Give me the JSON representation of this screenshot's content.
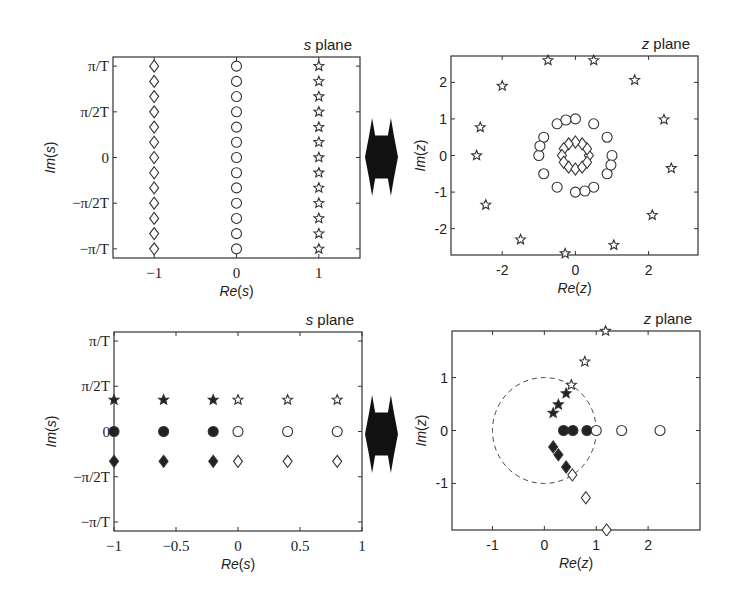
{
  "chart_data": [
    {
      "id": "s_top",
      "type": "scatter",
      "title": "s plane",
      "xlabel": "Re(s)",
      "ylabel": "Im(s)",
      "box": [
        113,
        57,
        360,
        258
      ],
      "xlim": [
        -1.5,
        1.5
      ],
      "ylim": [
        -1.1,
        1.1
      ],
      "xticks": [
        {
          "v": -1,
          "label": "−1"
        },
        {
          "v": 0,
          "label": "0"
        },
        {
          "v": 1,
          "label": "1"
        }
      ],
      "yticks": [
        {
          "v": 1,
          "label": "π/T"
        },
        {
          "v": 0.5,
          "label": "π/2T"
        },
        {
          "v": 0,
          "label": "0"
        },
        {
          "v": -0.5,
          "label": "−π/2T"
        },
        {
          "v": -1,
          "label": "−π/T"
        }
      ],
      "tickfont": "serif",
      "y_unit": "pi/T",
      "series": [
        {
          "name": "diamonds",
          "marker": "diamond",
          "filled": false,
          "x": [
            -1,
            -1,
            -1,
            -1,
            -1,
            -1,
            -1,
            -1,
            -1,
            -1,
            -1,
            -1,
            -1
          ],
          "y": [
            1,
            0.833,
            0.667,
            0.5,
            0.333,
            0.167,
            0,
            -0.167,
            -0.333,
            -0.5,
            -0.667,
            -0.833,
            -1
          ]
        },
        {
          "name": "circles",
          "marker": "circle",
          "filled": false,
          "x": [
            0,
            0,
            0,
            0,
            0,
            0,
            0,
            0,
            0,
            0,
            0,
            0,
            0
          ],
          "y": [
            1,
            0.833,
            0.667,
            0.5,
            0.333,
            0.167,
            0,
            -0.167,
            -0.333,
            -0.5,
            -0.667,
            -0.833,
            -1
          ]
        },
        {
          "name": "stars",
          "marker": "star",
          "filled": false,
          "x": [
            1,
            1,
            1,
            1,
            1,
            1,
            1,
            1,
            1,
            1,
            1,
            1,
            1
          ],
          "y": [
            1,
            0.833,
            0.667,
            0.5,
            0.333,
            0.167,
            0,
            -0.167,
            -0.333,
            -0.5,
            -0.667,
            -0.833,
            -1
          ]
        }
      ]
    },
    {
      "id": "z_top",
      "type": "scatter",
      "title": "z plane",
      "xlabel": "Re(z)",
      "ylabel": "Im(z)",
      "box": [
        451,
        56,
        698,
        255
      ],
      "xlim": [
        -3.4,
        3.35
      ],
      "ylim": [
        -2.72,
        2.72
      ],
      "xticks": [
        {
          "v": -2,
          "label": "-2"
        },
        {
          "v": 0,
          "label": "0"
        },
        {
          "v": 2,
          "label": "2"
        }
      ],
      "yticks": [
        {
          "v": 2,
          "label": "2"
        },
        {
          "v": 1,
          "label": "1"
        },
        {
          "v": 0,
          "label": "0"
        },
        {
          "v": -1,
          "label": "-1"
        },
        {
          "v": -2,
          "label": "-2"
        }
      ],
      "tickfont": "sans",
      "series": [
        {
          "name": "diamonds (|z|=e^-1)",
          "marker": "diamond",
          "filled": false,
          "x": [
            0.368,
            0.319,
            0.184,
            0,
            -0.184,
            -0.319,
            -0.368,
            -0.319,
            -0.184,
            0,
            0.184,
            0.319
          ],
          "y": [
            0,
            0.184,
            0.319,
            0.368,
            0.319,
            0.184,
            0,
            -0.184,
            -0.319,
            -0.368,
            -0.319,
            -0.184
          ]
        },
        {
          "name": "circles (|z|=1)",
          "marker": "circle",
          "filled": false,
          "x": [
            1,
            0.866,
            0.5,
            0,
            -0.5,
            -0.866,
            -1,
            -0.866,
            -0.5,
            0,
            0.5,
            0.866,
            -0.26,
            0.26,
            -0.97,
            0.97
          ],
          "y": [
            0,
            0.5,
            0.866,
            1,
            0.866,
            0.5,
            0,
            -0.5,
            -0.866,
            -1,
            -0.866,
            -0.5,
            0.97,
            -0.97,
            0.26,
            -0.26
          ]
        },
        {
          "name": "stars (|z|=e)",
          "marker": "star",
          "filled": false,
          "x": [
            -0.75,
            0.5,
            1.62,
            2.42,
            2.62,
            2.1,
            1.05,
            -0.28,
            -1.5,
            -2.45,
            -2.7,
            -2.6,
            -2.0
          ],
          "y": [
            2.6,
            2.6,
            2.06,
            0.98,
            -0.35,
            -1.63,
            -2.45,
            -2.68,
            -2.3,
            -1.35,
            0,
            0.77,
            1.9
          ]
        }
      ]
    },
    {
      "id": "s_bottom",
      "type": "scatter",
      "title": "s plane",
      "xlabel": "Re(s)",
      "ylabel": "Im(s)",
      "box": [
        114,
        332,
        362,
        531
      ],
      "xlim": [
        -1,
        1
      ],
      "ylim": [
        -1.1,
        1.1
      ],
      "xticks": [
        {
          "v": -1,
          "label": "−1"
        },
        {
          "v": -0.5,
          "label": "−0.5"
        },
        {
          "v": 0,
          "label": "0"
        },
        {
          "v": 0.5,
          "label": "0.5"
        },
        {
          "v": 1,
          "label": "1"
        }
      ],
      "yticks": [
        {
          "v": 1,
          "label": "π/T"
        },
        {
          "v": 0.5,
          "label": "π/2T"
        },
        {
          "v": 0,
          "label": "0"
        },
        {
          "v": -0.5,
          "label": "−π/2T"
        },
        {
          "v": -1,
          "label": "−π/T"
        }
      ],
      "tickfont": "serif",
      "y_unit": "pi/T",
      "series": [
        {
          "name": "filled stars",
          "marker": "star",
          "filled": true,
          "x": [
            -1,
            -0.6,
            -0.2
          ],
          "y": [
            0.35,
            0.35,
            0.35
          ]
        },
        {
          "name": "filled circles",
          "marker": "circle",
          "filled": true,
          "x": [
            -1,
            -0.6,
            -0.2
          ],
          "y": [
            0,
            0,
            0
          ]
        },
        {
          "name": "filled diamonds",
          "marker": "diamond",
          "filled": true,
          "x": [
            -1,
            -0.6,
            -0.2
          ],
          "y": [
            -0.33,
            -0.33,
            -0.33
          ]
        },
        {
          "name": "hollow stars",
          "marker": "star",
          "filled": false,
          "x": [
            0,
            0.4,
            0.8
          ],
          "y": [
            0.35,
            0.35,
            0.35
          ]
        },
        {
          "name": "hollow circles",
          "marker": "circle",
          "filled": false,
          "x": [
            0,
            0.4,
            0.8
          ],
          "y": [
            0,
            0,
            0
          ]
        },
        {
          "name": "hollow diamonds",
          "marker": "diamond",
          "filled": false,
          "x": [
            0,
            0.4,
            0.8
          ],
          "y": [
            -0.33,
            -0.33,
            -0.33
          ]
        }
      ]
    },
    {
      "id": "z_bottom",
      "type": "scatter",
      "title": "z plane",
      "xlabel": "Re(z)",
      "ylabel": "Im(z)",
      "box": [
        452,
        331,
        700,
        530
      ],
      "xlim": [
        -1.78,
        3.0
      ],
      "ylim": [
        -1.88,
        1.88
      ],
      "xticks": [
        {
          "v": -1,
          "label": "-1"
        },
        {
          "v": 0,
          "label": "0"
        },
        {
          "v": 1,
          "label": "1"
        },
        {
          "v": 2,
          "label": "2"
        }
      ],
      "yticks": [
        {
          "v": 1,
          "label": "1"
        },
        {
          "v": 0,
          "label": "0"
        },
        {
          "v": -1,
          "label": "-1"
        }
      ],
      "tickfont": "sans",
      "unit_circle": {
        "cx": 0,
        "cy": 0,
        "r": 1,
        "style": "dashed"
      },
      "series": [
        {
          "name": "filled stars",
          "marker": "star",
          "filled": true,
          "x": [
            0.17,
            0.27,
            0.42
          ],
          "y": [
            0.33,
            0.49,
            0.7
          ]
        },
        {
          "name": "filled circles",
          "marker": "circle",
          "filled": true,
          "x": [
            0.37,
            0.55,
            0.82
          ],
          "y": [
            0,
            0,
            0
          ]
        },
        {
          "name": "filled diamonds",
          "marker": "diamond",
          "filled": true,
          "x": [
            0.17,
            0.27,
            0.42
          ],
          "y": [
            -0.31,
            -0.46,
            -0.69
          ]
        },
        {
          "name": "hollow stars",
          "marker": "star",
          "filled": false,
          "x": [
            0.52,
            0.78,
            1.18
          ],
          "y": [
            0.86,
            1.3,
            1.88
          ]
        },
        {
          "name": "hollow circles",
          "marker": "circle",
          "filled": false,
          "x": [
            1.0,
            1.49,
            2.23
          ],
          "y": [
            0,
            0,
            0
          ]
        },
        {
          "name": "hollow diamonds",
          "marker": "diamond",
          "filled": false,
          "x": [
            0.54,
            0.8,
            1.2
          ],
          "y": [
            -0.84,
            -1.27,
            -1.88
          ]
        }
      ]
    }
  ],
  "arrows": [
    {
      "id": "arrow-top",
      "x": 365,
      "y": 118,
      "w": 33,
      "h": 78
    },
    {
      "id": "arrow-bottom",
      "x": 365,
      "y": 395,
      "w": 33,
      "h": 78
    }
  ],
  "colors": {
    "ink": "#2a2a2a",
    "frame": "#333333",
    "background": "#ffffff"
  }
}
